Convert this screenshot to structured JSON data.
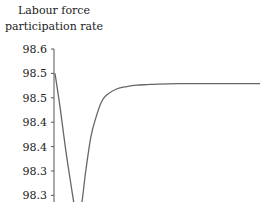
{
  "chart_data": {
    "type": "line",
    "title": "",
    "ylabel_lines": [
      "Labour force",
      "participation rate"
    ],
    "xlabel": "",
    "y_ticks": [
      "98.6",
      "98.5",
      "98.5",
      "98.4",
      "98.4",
      "98.3",
      "98.3"
    ],
    "y_tick_values": [
      98.6,
      98.55,
      98.5,
      98.45,
      98.4,
      98.35,
      98.3
    ],
    "ylim": [
      98.28,
      98.6
    ],
    "xlim": [
      0,
      40
    ],
    "grid": false,
    "legend": "none",
    "series": [
      {
        "name": "Labour force participation rate",
        "color": "#666666",
        "x": [
          0,
          1,
          2,
          3,
          4,
          5,
          6,
          7,
          8,
          9,
          10,
          12,
          14,
          16,
          18,
          20,
          24,
          28,
          32,
          36,
          40
        ],
        "y": [
          98.55,
          98.48,
          98.4,
          98.33,
          98.27,
          98.27,
          98.35,
          98.42,
          98.46,
          98.49,
          98.505,
          98.518,
          98.523,
          98.526,
          98.527,
          98.528,
          98.529,
          98.529,
          98.529,
          98.529,
          98.529
        ]
      }
    ]
  }
}
